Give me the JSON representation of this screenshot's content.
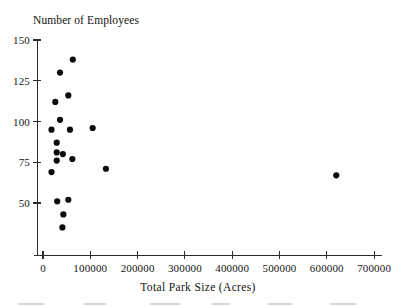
{
  "chart_data": {
    "type": "scatter",
    "title": "Number of Employees",
    "xlabel": "Total Park Size (Acres)",
    "ylabel": "Number of Employees",
    "xlim": [
      -30000,
      730000
    ],
    "ylim": [
      18,
      152
    ],
    "xticks": [
      0,
      100000,
      200000,
      300000,
      400000,
      500000,
      600000,
      700000
    ],
    "xticklabels": [
      "0",
      "100000",
      "200000",
      "300000",
      "400000",
      "500000",
      "600000",
      "700000"
    ],
    "yticks": [
      50,
      75,
      100,
      125,
      150
    ],
    "yticklabels": [
      "50",
      "75",
      "100",
      "125",
      "150"
    ],
    "grid": false,
    "legend": null,
    "marker": "filled-circle",
    "marker_color": "#0c0c0c",
    "points": [
      {
        "x": 63000,
        "y": 138
      },
      {
        "x": 36000,
        "y": 130
      },
      {
        "x": 53500,
        "y": 116
      },
      {
        "x": 26000,
        "y": 112
      },
      {
        "x": 36000,
        "y": 101
      },
      {
        "x": 18000,
        "y": 95
      },
      {
        "x": 57000,
        "y": 95
      },
      {
        "x": 105000,
        "y": 96
      },
      {
        "x": 29000,
        "y": 87
      },
      {
        "x": 29000,
        "y": 81
      },
      {
        "x": 42000,
        "y": 80
      },
      {
        "x": 29000,
        "y": 76
      },
      {
        "x": 62000,
        "y": 77
      },
      {
        "x": 18000,
        "y": 69
      },
      {
        "x": 133000,
        "y": 71
      },
      {
        "x": 620000,
        "y": 67
      },
      {
        "x": 30000,
        "y": 51
      },
      {
        "x": 53500,
        "y": 52
      },
      {
        "x": 43000,
        "y": 43
      },
      {
        "x": 41000,
        "y": 35
      }
    ]
  },
  "axes": {
    "x_axis_name": "x-axis",
    "y_axis_name": "y-axis"
  }
}
